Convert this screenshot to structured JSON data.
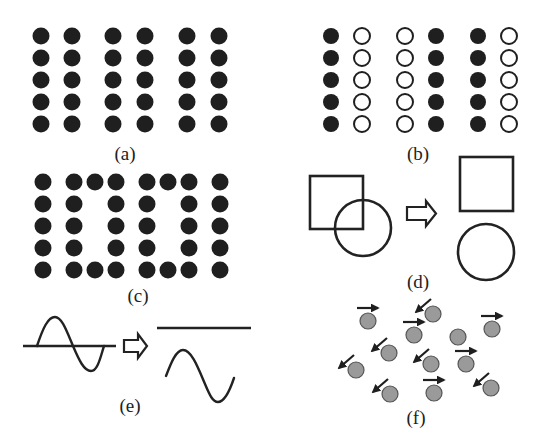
{
  "figure": {
    "panels": [
      {
        "id": "a",
        "label": "(a)",
        "label_pos": [
          125,
          160
        ]
      },
      {
        "id": "b",
        "label": "(b)",
        "label_pos": [
          418,
          160
        ]
      },
      {
        "id": "c",
        "label": "(c)",
        "label_pos": [
          138,
          302
        ]
      },
      {
        "id": "d",
        "label": "(d)",
        "label_pos": [
          418,
          288
        ]
      },
      {
        "id": "e",
        "label": "(e)",
        "label_pos": [
          130,
          412
        ]
      },
      {
        "id": "f",
        "label": "(f)",
        "label_pos": [
          416,
          424
        ]
      }
    ],
    "panel_a": {
      "description": "Pairs of identical filled dot columns",
      "columns_x": [
        41,
        72,
        113,
        145,
        187,
        219
      ],
      "rows_y": [
        36,
        58,
        80,
        102,
        124
      ],
      "column_fill": [
        "filled",
        "filled",
        "filled",
        "filled",
        "filled",
        "filled"
      ],
      "radius": 8.5
    },
    "panel_b": {
      "description": "Pairs of dot columns: filled/open alternating",
      "columns_x": [
        331,
        362,
        405,
        436,
        478,
        509
      ],
      "rows_y": [
        36,
        58,
        80,
        102,
        124
      ],
      "column_fill": [
        "filled",
        "open",
        "open",
        "filled",
        "filled",
        "open"
      ],
      "radius": 8
    },
    "panel_c": {
      "description": "Dots arranged forming the digits 1 0 0 1",
      "radius": 8.5,
      "dots": [
        [
          43,
          182
        ],
        [
          43,
          204
        ],
        [
          43,
          226
        ],
        [
          43,
          248
        ],
        [
          43,
          270
        ],
        [
          74,
          182
        ],
        [
          95,
          182
        ],
        [
          116,
          182
        ],
        [
          74,
          204
        ],
        [
          116,
          204
        ],
        [
          74,
          226
        ],
        [
          116,
          226
        ],
        [
          74,
          248
        ],
        [
          116,
          248
        ],
        [
          74,
          270
        ],
        [
          95,
          270
        ],
        [
          116,
          270
        ],
        [
          147,
          182
        ],
        [
          168,
          182
        ],
        [
          189,
          182
        ],
        [
          147,
          204
        ],
        [
          189,
          204
        ],
        [
          147,
          226
        ],
        [
          189,
          226
        ],
        [
          147,
          248
        ],
        [
          189,
          248
        ],
        [
          147,
          270
        ],
        [
          168,
          270
        ],
        [
          189,
          270
        ],
        [
          220,
          182
        ],
        [
          220,
          204
        ],
        [
          220,
          226
        ],
        [
          220,
          248
        ],
        [
          220,
          270
        ]
      ]
    },
    "panel_d": {
      "description": "Overlapping square and circle separated into distinct shapes",
      "before": {
        "square": {
          "x": 310,
          "y": 176,
          "w": 53,
          "h": 53
        },
        "circle": {
          "cx": 363,
          "cy": 228,
          "r": 28
        }
      },
      "after": {
        "square": {
          "x": 460,
          "y": 157,
          "w": 53,
          "h": 54
        },
        "circle": {
          "cx": 486,
          "cy": 252,
          "r": 28
        }
      },
      "arrow": "hollow-right-arrow"
    },
    "panel_e": {
      "description": "Sine wave on baseline separated into baseline and wave",
      "left_axis": {
        "x1": 23,
        "x2": 116,
        "y": 346
      },
      "right_axis": {
        "x1": 157,
        "x2": 251,
        "y": 328
      },
      "arrow": "hollow-right-arrow"
    },
    "panel_f": {
      "description": "Particles with random velocity directions",
      "particle_radius": 8,
      "particles": [
        {
          "cx": 368,
          "cy": 321,
          "arrow": "right"
        },
        {
          "cx": 433,
          "cy": 314,
          "arrow": "down-left"
        },
        {
          "cx": 414,
          "cy": 335,
          "arrow": "right"
        },
        {
          "cx": 458,
          "cy": 337,
          "arrow": "none"
        },
        {
          "cx": 492,
          "cy": 329,
          "arrow": "right"
        },
        {
          "cx": 389,
          "cy": 353,
          "arrow": "down-left"
        },
        {
          "cx": 356,
          "cy": 370,
          "arrow": "down-left"
        },
        {
          "cx": 431,
          "cy": 364,
          "arrow": "down-left"
        },
        {
          "cx": 466,
          "cy": 364,
          "arrow": "right"
        },
        {
          "cx": 390,
          "cy": 394,
          "arrow": "down-left"
        },
        {
          "cx": 434,
          "cy": 393,
          "arrow": "right"
        },
        {
          "cx": 491,
          "cy": 388,
          "arrow": "down-left"
        }
      ]
    },
    "colors": {
      "ink": "#1f1f1f",
      "particle_fill": "#9a9a9a",
      "particle_stroke": "#555555",
      "background": "#ffffff"
    }
  }
}
